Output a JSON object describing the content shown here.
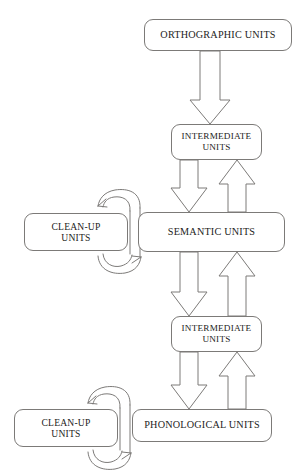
{
  "figure": {
    "type": "flow-diagram",
    "title": "",
    "background_color": "#ffffff",
    "stroke_color": "#7c7a78",
    "text_color": "#1d1c1b"
  },
  "nodes": [
    {
      "id": "orthographic-units",
      "label": "ORTHOGRAPHIC UNITS",
      "x": 144,
      "y": 19,
      "width": 148,
      "height": 32
    },
    {
      "id": "intermediate-units-upper",
      "label": "INTERMEDIATE\nUNITS",
      "x": 171,
      "y": 124,
      "width": 91,
      "height": 36
    },
    {
      "id": "semantic-units",
      "label": "SEMANTIC UNITS",
      "x": 138,
      "y": 212,
      "width": 147,
      "height": 40
    },
    {
      "id": "clean-up-units-upper",
      "label": "CLEAN-UP\nUNITS",
      "x": 24,
      "y": 213,
      "width": 104,
      "height": 38
    },
    {
      "id": "intermediate-units-lower",
      "label": "INTERMEDIATE\nUNITS",
      "x": 171,
      "y": 316,
      "width": 91,
      "height": 36
    },
    {
      "id": "phonological-units",
      "label": "PHONOLOGICAL UNITS",
      "x": 132,
      "y": 409,
      "width": 140,
      "height": 33
    },
    {
      "id": "clean-up-units-lower",
      "label": "CLEAN-UP\nUNITS",
      "x": 14,
      "y": 409,
      "width": 104,
      "height": 38
    }
  ],
  "connectors": [
    {
      "id": "arrow-orthographic-to-intermediate-upper",
      "kind": "block-arrow",
      "direction": "down",
      "from": "orthographic-units",
      "to": "intermediate-units-upper"
    },
    {
      "id": "arrow-intermediate-upper-to-semantic",
      "kind": "block-arrow",
      "direction": "down",
      "from": "intermediate-units-upper",
      "to": "semantic-units"
    },
    {
      "id": "arrow-semantic-to-intermediate-upper",
      "kind": "block-arrow",
      "direction": "up",
      "from": "semantic-units",
      "to": "intermediate-units-upper"
    },
    {
      "id": "arrow-semantic-to-intermediate-lower",
      "kind": "block-arrow",
      "direction": "down",
      "from": "semantic-units",
      "to": "intermediate-units-lower"
    },
    {
      "id": "arrow-intermediate-lower-to-semantic",
      "kind": "block-arrow",
      "direction": "up",
      "from": "intermediate-units-lower",
      "to": "semantic-units"
    },
    {
      "id": "arrow-intermediate-lower-to-phonological",
      "kind": "block-arrow",
      "direction": "down",
      "from": "intermediate-units-lower",
      "to": "phonological-units"
    },
    {
      "id": "arrow-phonological-to-intermediate-lower",
      "kind": "block-arrow",
      "direction": "up",
      "from": "phonological-units",
      "to": "intermediate-units-lower"
    },
    {
      "id": "curve-semantic-to-cleanup-upper",
      "kind": "curved-arrow",
      "direction": "left",
      "from": "semantic-units",
      "to": "clean-up-units-upper"
    },
    {
      "id": "curve-cleanup-upper-to-semantic",
      "kind": "curved-arrow",
      "direction": "right",
      "from": "clean-up-units-upper",
      "to": "semantic-units"
    },
    {
      "id": "curve-phonological-to-cleanup-lower",
      "kind": "curved-arrow",
      "direction": "left",
      "from": "phonological-units",
      "to": "clean-up-units-lower"
    },
    {
      "id": "curve-cleanup-lower-to-phonological",
      "kind": "curved-arrow",
      "direction": "right",
      "from": "clean-up-units-lower",
      "to": "phonological-units"
    }
  ]
}
